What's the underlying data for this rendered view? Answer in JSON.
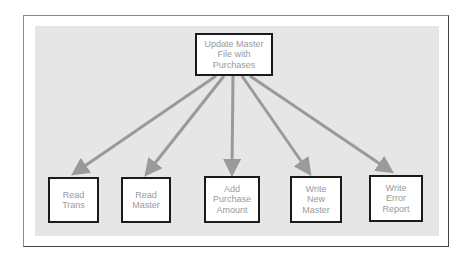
{
  "diagram": {
    "type": "hierarchy-chart",
    "root": {
      "label": "Update Master\nFile with\nPurchases"
    },
    "children": [
      {
        "label": "Read\nTrans"
      },
      {
        "label": "Read\nMaster"
      },
      {
        "label": "Add\nPurchase\nAmount"
      },
      {
        "label": "Write\nNew\nMaster"
      },
      {
        "label": "Write\nError\nReport"
      }
    ],
    "colors": {
      "panel": "#e6e6e6",
      "arrow": "#9a9a9a",
      "box_border": "#1a1a1a",
      "text": "#9a9a9a"
    }
  }
}
